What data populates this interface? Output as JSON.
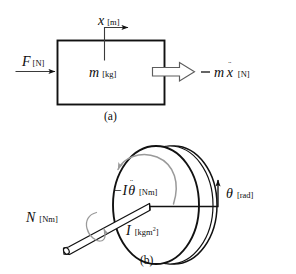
{
  "figure": {
    "background": "#ffffff",
    "ink": "#111111",
    "accent_gray": "#9a9a9a"
  },
  "panel_a": {
    "caption": "(a)",
    "body_symbol": "m",
    "body_unit": "[kg]",
    "applied_force_symbol": "F",
    "applied_force_unit": "[N]",
    "displacement_symbol": "x",
    "displacement_unit": "[m]",
    "inertia_force_sign": "−",
    "inertia_force_symbol": "m",
    "inertia_force_variable": "x",
    "inertia_force_dots": "¨",
    "inertia_force_unit": "[N]"
  },
  "panel_b": {
    "caption": "(b)",
    "inertia_symbol": "I",
    "inertia_unit": "[kgm",
    "inertia_unit_sup": "2",
    "inertia_unit_close": "]",
    "torque_symbol": "N",
    "torque_unit": "[Nm]",
    "angle_symbol": "θ",
    "angle_unit": "[rad]",
    "inertia_torque_sign": "−",
    "inertia_torque_symbol": "I",
    "inertia_torque_variable": "θ",
    "inertia_torque_dots": "¨",
    "inertia_torque_unit": "[Nm]"
  }
}
